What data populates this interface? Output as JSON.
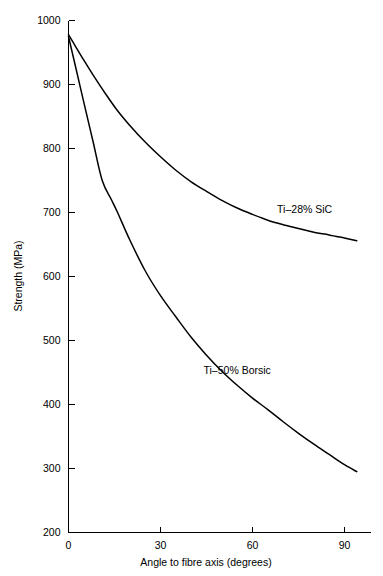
{
  "chart_data": {
    "type": "line",
    "title": "",
    "subtitle": "",
    "xlabel": "Angle to fibre axis   (degrees)",
    "ylabel": "Strength   (MPa)",
    "xlim": [
      0,
      95
    ],
    "ylim": [
      200,
      1000
    ],
    "grid": false,
    "legend_position": "inline-annotation",
    "x_ticks": [
      {
        "value": 0,
        "label": "0"
      },
      {
        "value": 30,
        "label": "30"
      },
      {
        "value": 60,
        "label": "60"
      },
      {
        "value": 90,
        "label": "90"
      }
    ],
    "y_ticks": [
      {
        "value": 200,
        "label": "200"
      },
      {
        "value": 300,
        "label": "300"
      },
      {
        "value": 400,
        "label": "400"
      },
      {
        "value": 500,
        "label": "500"
      },
      {
        "value": 600,
        "label": "600"
      },
      {
        "value": 700,
        "label": "700"
      },
      {
        "value": 800,
        "label": "800"
      },
      {
        "value": 900,
        "label": "900"
      },
      {
        "value": 1000,
        "label": "1000"
      }
    ],
    "series": [
      {
        "name": "Ti–28% SiC",
        "color": "#000000",
        "annotation": {
          "text": "Ti–28% SiC",
          "x": 77,
          "y": 700
        },
        "x": [
          0,
          2,
          5,
          8,
          12,
          16,
          20,
          25,
          30,
          35,
          40,
          45,
          50,
          55,
          60,
          65,
          70,
          75,
          80,
          85,
          90,
          94
        ],
        "values": [
          978,
          962,
          938,
          915,
          886,
          859,
          836,
          810,
          787,
          766,
          748,
          733,
          719,
          707,
          697,
          688,
          681,
          675,
          669,
          665,
          660,
          656
        ]
      },
      {
        "name": "Ti–50% Borsic",
        "color": "#000000",
        "annotation": {
          "text": "Ti–50% Borsic",
          "x": 55,
          "y": 448
        },
        "x": [
          0,
          2,
          5,
          8,
          11,
          14,
          16,
          20,
          25,
          30,
          35,
          40,
          45,
          50,
          55,
          60,
          65,
          70,
          75,
          80,
          85,
          90,
          94
        ],
        "values": [
          975,
          934,
          872,
          811,
          750,
          720,
          700,
          657,
          609,
          570,
          537,
          505,
          477,
          452,
          430,
          410,
          392,
          373,
          355,
          338,
          322,
          306,
          295
        ]
      }
    ]
  },
  "axes": {
    "y_axis_name": "Strength",
    "y_axis_unit": "(MPa)",
    "x_axis_name": "Angle to fibre axis",
    "x_axis_unit": "(degrees)"
  }
}
